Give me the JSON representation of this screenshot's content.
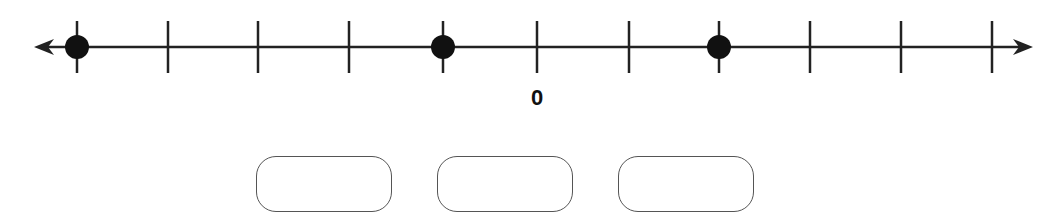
{
  "number_line": {
    "line_y": 47,
    "x_start": 34,
    "x_end": 1033,
    "tick_positions": [
      77,
      168,
      258,
      349,
      443,
      537,
      629,
      719,
      810,
      901,
      992
    ],
    "tick_half_height": 26,
    "points": [
      {
        "x": 77
      },
      {
        "x": 443
      },
      {
        "x": 719
      }
    ],
    "zero_tick_x": 537,
    "zero_label": "0",
    "color": "#222222"
  },
  "answer_boxes": [
    {
      "left": 256,
      "value": ""
    },
    {
      "left": 437,
      "value": ""
    },
    {
      "left": 618,
      "value": ""
    }
  ]
}
